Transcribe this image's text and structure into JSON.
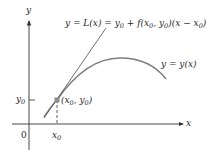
{
  "figure": {
    "type": "diagram",
    "axes": {
      "x_label": "x",
      "y_label": "y",
      "origin_label": "0"
    },
    "ticks": {
      "x0_label": "x",
      "x0_sub": "0",
      "y0_label": "y",
      "y0_sub": "0"
    },
    "point": {
      "label_open": "(",
      "label_x": "x",
      "label_x_sub": "0",
      "label_comma": ", ",
      "label_y": "y",
      "label_y_sub": "0",
      "label_close": ")"
    },
    "tangent_label": {
      "p1": "y = L(x) = y",
      "p1_sub": "0",
      "p2": " + f(x",
      "p2_sub": "0",
      "p3": ", y",
      "p3_sub": "0",
      "p4": ")(x − x",
      "p4_sub": "0",
      "p5": ")"
    },
    "curve_label": "y = y(x)",
    "colors": {
      "axis": "#333333",
      "curve": "#7a7a7a",
      "tangent": "#555555",
      "point": "#8c8c8c",
      "text": "#2a2a2a"
    }
  }
}
